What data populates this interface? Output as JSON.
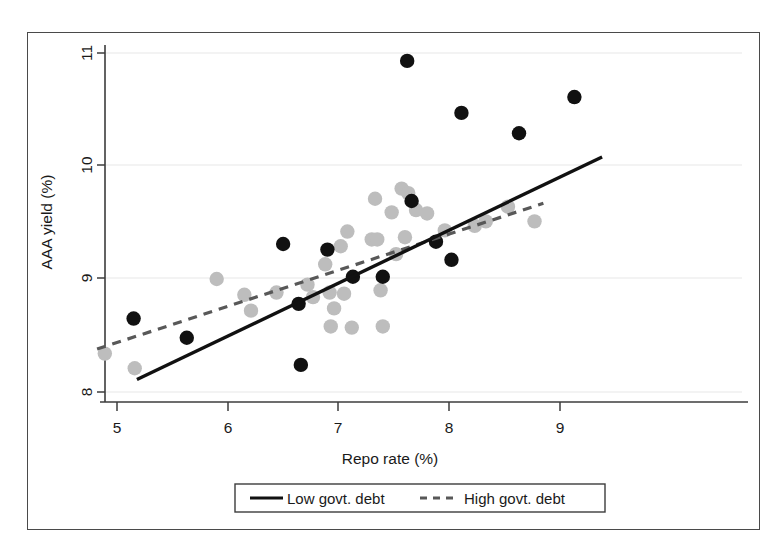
{
  "chart_data": {
    "type": "scatter",
    "title": "",
    "xlabel": "Repo rate (%)",
    "ylabel": "AAA yield (%)",
    "xlim": [
      4.75,
      9.35
    ],
    "ylim": [
      7.82,
      11.15
    ],
    "xticks": [
      5,
      6,
      7,
      8,
      9
    ],
    "xtick_labels": [
      "5",
      "6",
      "7",
      "8",
      "9"
    ],
    "yticks": [
      8,
      9,
      10,
      11
    ],
    "ytick_labels": [
      "8",
      "9",
      "10",
      "11"
    ],
    "grid": "horizontal-only-light",
    "legend_position": "below-axes-boxed",
    "series": [
      {
        "name": "Low govt. debt",
        "marker": "filled-circle",
        "color": "#111111",
        "line_style": "solid",
        "points": [
          {
            "x": 5.15,
            "y": 8.65
          },
          {
            "x": 5.63,
            "y": 8.48
          },
          {
            "x": 6.5,
            "y": 9.31
          },
          {
            "x": 6.64,
            "y": 8.78
          },
          {
            "x": 6.66,
            "y": 8.24
          },
          {
            "x": 6.9,
            "y": 9.26
          },
          {
            "x": 7.13,
            "y": 9.02
          },
          {
            "x": 7.4,
            "y": 9.02
          },
          {
            "x": 7.62,
            "y": 10.93
          },
          {
            "x": 7.66,
            "y": 9.69
          },
          {
            "x": 7.88,
            "y": 9.33
          },
          {
            "x": 8.02,
            "y": 9.17
          },
          {
            "x": 8.11,
            "y": 10.47
          },
          {
            "x": 8.63,
            "y": 10.29
          },
          {
            "x": 9.13,
            "y": 10.61
          }
        ],
        "trend_line": {
          "x_start": 5.18,
          "y_start": 8.11,
          "x_end": 9.38,
          "y_end": 10.08
        }
      },
      {
        "name": "High govt. debt",
        "marker": "filled-circle",
        "color": "#bdbdbd",
        "line_style": "dashed",
        "points": [
          {
            "x": 4.89,
            "y": 8.34
          },
          {
            "x": 5.16,
            "y": 8.21
          },
          {
            "x": 5.9,
            "y": 9.0
          },
          {
            "x": 6.15,
            "y": 8.86
          },
          {
            "x": 6.21,
            "y": 8.72
          },
          {
            "x": 6.44,
            "y": 8.88
          },
          {
            "x": 6.72,
            "y": 8.95
          },
          {
            "x": 6.77,
            "y": 8.84
          },
          {
            "x": 6.88,
            "y": 9.13
          },
          {
            "x": 6.92,
            "y": 8.88
          },
          {
            "x": 6.93,
            "y": 8.58
          },
          {
            "x": 6.96,
            "y": 8.74
          },
          {
            "x": 7.02,
            "y": 9.29
          },
          {
            "x": 7.05,
            "y": 8.87
          },
          {
            "x": 7.08,
            "y": 9.42
          },
          {
            "x": 7.12,
            "y": 8.57
          },
          {
            "x": 7.3,
            "y": 9.35
          },
          {
            "x": 7.33,
            "y": 9.71
          },
          {
            "x": 7.35,
            "y": 9.35
          },
          {
            "x": 7.38,
            "y": 8.9
          },
          {
            "x": 7.4,
            "y": 8.58
          },
          {
            "x": 7.48,
            "y": 9.59
          },
          {
            "x": 7.52,
            "y": 9.22
          },
          {
            "x": 7.57,
            "y": 9.8
          },
          {
            "x": 7.6,
            "y": 9.37
          },
          {
            "x": 7.63,
            "y": 9.76
          },
          {
            "x": 7.7,
            "y": 9.61
          },
          {
            "x": 7.8,
            "y": 9.58
          },
          {
            "x": 7.96,
            "y": 9.43
          },
          {
            "x": 8.23,
            "y": 9.47
          },
          {
            "x": 8.33,
            "y": 9.51
          },
          {
            "x": 8.53,
            "y": 9.64
          },
          {
            "x": 8.77,
            "y": 9.51
          }
        ],
        "trend_line": {
          "x_start": 4.82,
          "y_start": 8.38,
          "x_end": 8.85,
          "y_end": 9.67
        }
      }
    ]
  },
  "legend": {
    "items": [
      {
        "label": "Low govt. debt",
        "style": "solid"
      },
      {
        "label": "High govt. debt",
        "style": "dashed"
      }
    ]
  },
  "colors": {
    "low_debt_marker": "#111111",
    "high_debt_marker": "#bdbdbd",
    "frame": "#4a4a4a",
    "gridline": "#efefef",
    "text": "#1a1a1a"
  }
}
